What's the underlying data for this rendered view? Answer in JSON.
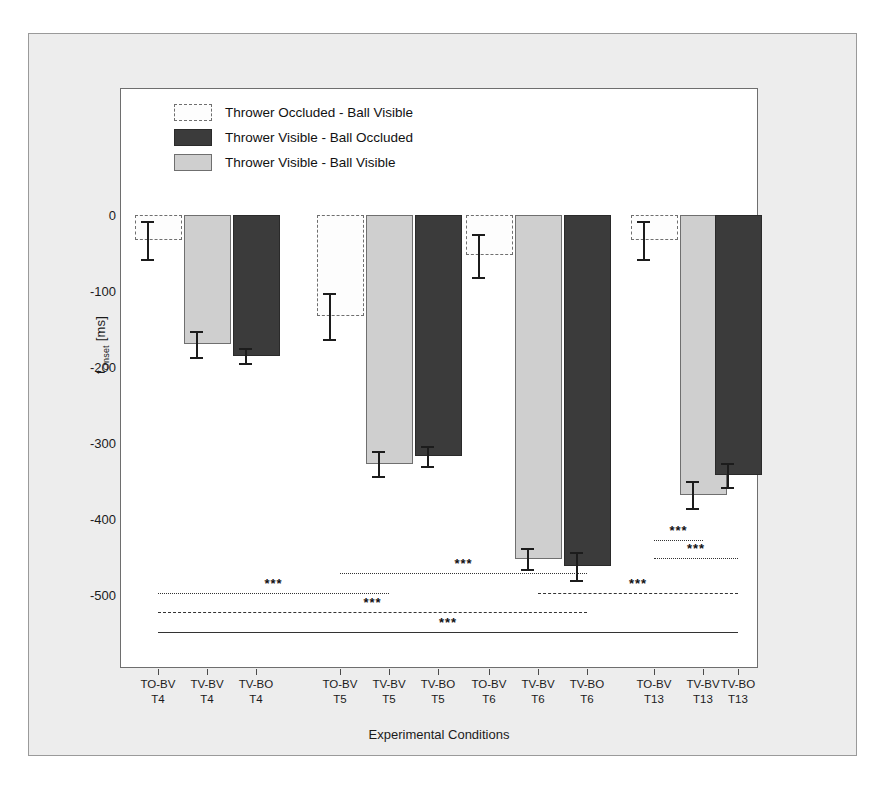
{
  "chart_data": {
    "type": "bar",
    "title": "",
    "xlabel": "Experimental Conditions",
    "ylabel": "t_Onset [ms]",
    "ylabel_main": "t",
    "ylabel_sub": "Onset",
    "ylabel_unit": " [ms]",
    "ylim": [
      -550,
      20
    ],
    "ytick_labels": [
      "0",
      "-100",
      "-200",
      "-300",
      "-400",
      "-500"
    ],
    "ytick_values": [
      0,
      -100,
      -200,
      -300,
      -400,
      -500
    ],
    "yminor_values": [
      -50,
      -150,
      -250,
      -350,
      -450,
      -550
    ],
    "grid": false,
    "legend_position": "top-left-inside",
    "categories": [
      "TO-BV T4",
      "TV-BV T4",
      "TV-BO T4",
      "TO-BV T5",
      "TV-BV T5",
      "TV-BO T5",
      "TO-BV T6",
      "TV-BV T6",
      "TV-BO T6",
      "TO-BV T13",
      "TV-BV T13",
      "TV-BO T13"
    ],
    "category_labels": [
      {
        "line1": "TO-BV",
        "line2": "T4"
      },
      {
        "line1": "TV-BV",
        "line2": "T4"
      },
      {
        "line1": "TV-BO",
        "line2": "T4"
      },
      {
        "line1": "TO-BV",
        "line2": "T5"
      },
      {
        "line1": "TV-BV",
        "line2": "T5"
      },
      {
        "line1": "TV-BO",
        "line2": "T5"
      },
      {
        "line1": "TO-BV",
        "line2": "T6"
      },
      {
        "line1": "TV-BV",
        "line2": "T6"
      },
      {
        "line1": "TV-BO",
        "line2": "T6"
      },
      {
        "line1": "TO-BV",
        "line2": "T13"
      },
      {
        "line1": "TV-BV",
        "line2": "T13"
      },
      {
        "line1": "TV-BO",
        "line2": "T13"
      }
    ],
    "series": [
      {
        "name": "Thrower Occluded - Ball Visible",
        "key": "TO-BV",
        "fill": "white",
        "values": [
          -33,
          null,
          null,
          -133,
          null,
          null,
          -53,
          null,
          null,
          -33,
          null,
          null
        ],
        "errors": [
          25,
          null,
          null,
          30,
          null,
          null,
          28,
          null,
          null,
          25,
          null,
          null
        ]
      },
      {
        "name": "Thrower Visible - Ball Occluded",
        "key": "TV-BO",
        "fill": "dark",
        "values": [
          null,
          null,
          -185,
          null,
          null,
          -317,
          null,
          null,
          -462,
          null,
          null,
          -342
        ],
        "errors": [
          null,
          null,
          10,
          null,
          null,
          13,
          null,
          null,
          18,
          null,
          null,
          16
        ]
      },
      {
        "name": "Thrower Visible - Ball Visible",
        "key": "TV-BV",
        "fill": "lightgray",
        "values": [
          null,
          -170,
          null,
          null,
          -327,
          null,
          null,
          -452,
          null,
          null,
          -368,
          null
        ],
        "errors": [
          null,
          17,
          null,
          null,
          17,
          null,
          null,
          14,
          null,
          null,
          18,
          null
        ]
      }
    ],
    "bars": [
      {
        "category": "TO-BV T4",
        "series": "Thrower Occluded - Ball Visible",
        "fill": "white",
        "value": -33,
        "error": 25
      },
      {
        "category": "TV-BV T4",
        "series": "Thrower Visible - Ball Visible",
        "fill": "lightgray",
        "value": -170,
        "error": 17
      },
      {
        "category": "TV-BO T4",
        "series": "Thrower Visible - Ball Occluded",
        "fill": "dark",
        "value": -185,
        "error": 10
      },
      {
        "category": "TO-BV T5",
        "series": "Thrower Occluded - Ball Visible",
        "fill": "white",
        "value": -133,
        "error": 30
      },
      {
        "category": "TV-BV T5",
        "series": "Thrower Visible - Ball Visible",
        "fill": "lightgray",
        "value": -327,
        "error": 17
      },
      {
        "category": "TV-BO T5",
        "series": "Thrower Visible - Ball Occluded",
        "fill": "dark",
        "value": -317,
        "error": 13
      },
      {
        "category": "TO-BV T6",
        "series": "Thrower Occluded - Ball Visible",
        "fill": "white",
        "value": -53,
        "error": 28
      },
      {
        "category": "TV-BV T6",
        "series": "Thrower Visible - Ball Visible",
        "fill": "lightgray",
        "value": -452,
        "error": 14
      },
      {
        "category": "TV-BO T6",
        "series": "Thrower Visible - Ball Occluded",
        "fill": "dark",
        "value": -462,
        "error": 18
      },
      {
        "category": "TO-BV T13",
        "series": "Thrower Occluded - Ball Visible",
        "fill": "white",
        "value": -33,
        "error": 25
      },
      {
        "category": "TV-BV T13",
        "series": "Thrower Visible - Ball Visible",
        "fill": "lightgray",
        "value": -368,
        "error": 18
      },
      {
        "category": "TV-BO T13",
        "series": "Thrower Visible - Ball Occluded",
        "fill": "dark",
        "value": -342,
        "error": 16
      }
    ],
    "significance_markers": [
      {
        "label": "***",
        "from_index": 0,
        "to_index": 4,
        "y": -497,
        "style": "dotted"
      },
      {
        "label": "***",
        "from_index": 3,
        "to_index": 8,
        "y": -471,
        "style": "dotted"
      },
      {
        "label": "***",
        "from_index": 0,
        "to_index": 8,
        "y": -523,
        "style": "dashed"
      },
      {
        "label": "***",
        "from_index": 7,
        "to_index": 11,
        "y": -497,
        "style": "dashed"
      },
      {
        "label": "***",
        "from_index": 0,
        "to_index": 11,
        "y": -549,
        "style": "solid"
      },
      {
        "label": "***",
        "from_index": 9,
        "to_index": 10,
        "y": -428,
        "style": "dotted"
      },
      {
        "label": "***",
        "from_index": 9,
        "to_index": 11,
        "y": -451,
        "style": "dotted"
      }
    ],
    "legend_entries": [
      {
        "label": "Thrower Occluded - Ball Visible",
        "fill": "white"
      },
      {
        "label": "Thrower Visible - Ball Occluded",
        "fill": "dark"
      },
      {
        "label": "Thrower Visible - Ball Visible",
        "fill": "lightgray"
      }
    ],
    "colors": {
      "white_bar": "#fdfdfd",
      "light_gray_bar": "#cfcfcf",
      "dark_bar": "#3b3b3b",
      "figure_background": "#ededed",
      "plot_background": "#ffffff",
      "axis": "#4a4a4a",
      "text": "#1b1b1b"
    }
  }
}
